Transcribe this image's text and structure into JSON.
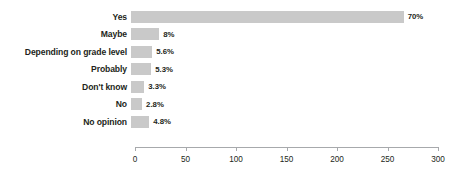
{
  "chart_data": {
    "type": "bar",
    "orientation": "horizontal",
    "title": "",
    "xlabel": "",
    "ylabel": "",
    "xlim": [
      0,
      300
    ],
    "xticks": [
      0,
      50,
      100,
      150,
      200,
      250,
      300
    ],
    "xtick_labels": [
      "0",
      "50",
      "100",
      "150",
      "200",
      "250",
      "300"
    ],
    "grid": false,
    "legend": false,
    "bar_color": "#c9c9c9",
    "text_color": "#231f20",
    "axis_color": "#a7a9ac",
    "categories": [
      "Yes",
      "Maybe",
      "Depending on grade level",
      "Probably",
      "Don't know",
      "No",
      "No opinion"
    ],
    "values": [
      270,
      28,
      21,
      20,
      13,
      11,
      18
    ],
    "data_labels": [
      "70%",
      "8%",
      "5.6%",
      "5.3%",
      "3.3%",
      "2.8%",
      "4.8%"
    ],
    "bars": [
      {
        "category": "Yes",
        "value": 270,
        "label": "70%"
      },
      {
        "category": "Maybe",
        "value": 28,
        "label": "8%"
      },
      {
        "category": "Depending on grade level",
        "value": 21,
        "label": "5.6%"
      },
      {
        "category": "Probably",
        "value": 20,
        "label": "5.3%"
      },
      {
        "category": "Don't know",
        "value": 13,
        "label": "3.3%"
      },
      {
        "category": "No",
        "value": 11,
        "label": "2.8%"
      },
      {
        "category": "No opinion",
        "value": 18,
        "label": "4.8%"
      }
    ]
  }
}
